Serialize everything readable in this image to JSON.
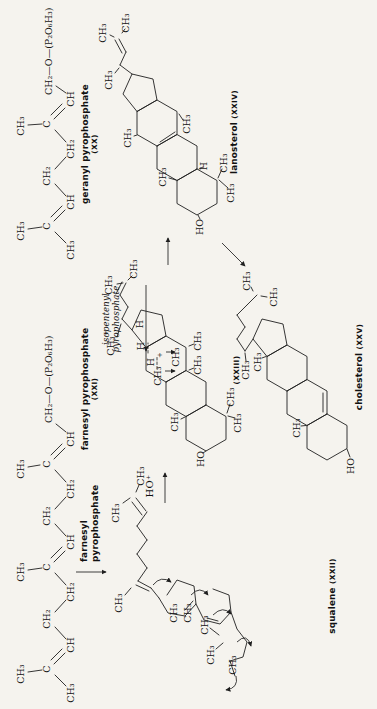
{
  "page": {
    "background_color": "#f5f3ee",
    "ink_color": "#1f1f1f"
  },
  "labels": {
    "geranyl": {
      "name": "geranyl pyrophosphate",
      "numeral": "(XX)"
    },
    "farnesyl": {
      "name": "farnesyl pyrophosphate",
      "numeral": "(XXI)"
    },
    "squalene": {
      "name": "squalene",
      "numeral": "(XXII)"
    },
    "cation": {
      "numeral": "(XXIII)"
    },
    "lanosterol": {
      "name": "lanosterol",
      "numeral": "(XXIV)"
    },
    "cholesterol": {
      "name": "cholesterol",
      "numeral": "(XXV)"
    },
    "isopentenyl_arrow": {
      "line1": "isopentenyl",
      "line2": "pyrophosphate"
    },
    "farnesyl_arrow": {
      "line1": "farnesyl",
      "line2": "pyrophosphate"
    },
    "ho_plus": "HO⁺"
  },
  "figure": {
    "texts": [
      [
        "CH₃",
        478,
        24
      ],
      [
        "C",
        483,
        50
      ],
      [
        "CH₃",
        459,
        74
      ],
      [
        "CH",
        507,
        74
      ],
      [
        "CH₂",
        533,
        50
      ],
      [
        "CH₂",
        560,
        74
      ],
      [
        "C",
        585,
        50
      ],
      [
        "CH₃",
        583,
        24
      ],
      [
        "CH",
        610,
        74
      ],
      [
        "CH₂—O—(P₂O₆H₃)",
        614,
        52,
        "start"
      ],
      [
        "CH₃",
        16,
        74
      ],
      [
        "C",
        40,
        50
      ],
      [
        "CH₃",
        35,
        24
      ],
      [
        "CH",
        64,
        74
      ],
      [
        "CH₂",
        90,
        50
      ],
      [
        "CH₂",
        117,
        74
      ],
      [
        "C",
        142,
        50
      ],
      [
        "CH₃",
        137,
        24
      ],
      [
        "CH",
        167,
        74
      ],
      [
        "CH₂",
        193,
        50
      ],
      [
        "CH₂",
        220,
        74
      ],
      [
        "C",
        245,
        50
      ],
      [
        "CH₃",
        240,
        24
      ],
      [
        "CH",
        270,
        74
      ],
      [
        "CH₂—O—(P₂O₆H₃)",
        286,
        52,
        "start"
      ],
      [
        "CH₃",
        196,
        119
      ],
      [
        "CH₃",
        233,
        144
      ],
      [
        "CH₃",
        106,
        122
      ],
      [
        "CH₃",
        96,
        177
      ],
      [
        "CH₃",
        96,
        191
      ],
      [
        "CH₃",
        54,
        214
      ],
      [
        "CH₃",
        84,
        208
      ],
      [
        "CH₃",
        44,
        236
      ],
      [
        "CH₃",
        363,
        114
      ],
      [
        "+",
        376,
        108,
        "sm"
      ],
      [
        "CH₃",
        424,
        112
      ],
      [
        "CH₃",
        440,
        137
      ],
      [
        "H",
        347,
        154
      ],
      [
        "H",
        363,
        144
      ],
      [
        "+",
        354,
        162,
        "sm"
      ],
      [
        "H",
        385,
        143
      ],
      [
        "CH₃",
        333,
        161
      ],
      [
        "CH₃",
        352,
        179
      ],
      [
        "CH₃",
        287,
        178
      ],
      [
        "CH₃",
        344,
        201
      ],
      [
        "CH₃",
        368,
        201
      ],
      [
        "HO",
        250,
        204
      ],
      [
        "CH₃",
        286,
        241
      ],
      [
        "CH₃",
        312,
        234
      ],
      [
        "HO",
        482,
        203
      ],
      [
        "CH₃",
        516,
        234
      ],
      [
        "CH₃",
        546,
        227
      ],
      [
        "H",
        543,
        207
      ],
      [
        "CH₃",
        532,
        166
      ],
      [
        "CH₃",
        571,
        131
      ],
      [
        "CH₃",
        585,
        190
      ],
      [
        "CH₃",
        629,
        112
      ],
      [
        "CH₃",
        676,
        106
      ],
      [
        "CH₃",
        686,
        129
      ],
      [
        "HO",
        243,
        354
      ],
      [
        "CH₃",
        281,
        300
      ],
      [
        "CH₃",
        347,
        261
      ],
      [
        "CH₃",
        339,
        249
      ],
      [
        "CH₃",
        428,
        250
      ],
      [
        "CH₃",
        412,
        277
      ]
    ],
    "bonds": [
      [
        466,
        66,
        477,
        55
      ],
      [
        480,
        28,
        482,
        42
      ],
      [
        488,
        54,
        499,
        65
      ],
      [
        492,
        51,
        503,
        62
      ],
      [
        513,
        66,
        525,
        55
      ],
      [
        540,
        55,
        552,
        66
      ],
      [
        567,
        66,
        579,
        55
      ],
      [
        584,
        28,
        585,
        42
      ],
      [
        590,
        54,
        601,
        65
      ],
      [
        594,
        51,
        605,
        62
      ],
      [
        616,
        66,
        623,
        56
      ],
      [
        23,
        66,
        34,
        55
      ],
      [
        37,
        28,
        39,
        42
      ],
      [
        45,
        54,
        56,
        65
      ],
      [
        49,
        51,
        60,
        62
      ],
      [
        70,
        66,
        82,
        55
      ],
      [
        97,
        55,
        109,
        66
      ],
      [
        124,
        66,
        136,
        55
      ],
      [
        139,
        28,
        141,
        42
      ],
      [
        147,
        54,
        158,
        65
      ],
      [
        151,
        51,
        162,
        62
      ],
      [
        173,
        66,
        185,
        55
      ],
      [
        200,
        55,
        212,
        66
      ],
      [
        227,
        66,
        239,
        55
      ],
      [
        242,
        28,
        244,
        40
      ],
      [
        250,
        54,
        261,
        65
      ],
      [
        254,
        51,
        265,
        62
      ],
      [
        277,
        66,
        285,
        56
      ],
      [
        206,
        123,
        211,
        130
      ],
      [
        224,
        139,
        217,
        136
      ],
      [
        211,
        136,
        198,
        146
      ],
      [
        207,
        132,
        194,
        142
      ],
      [
        197,
        147,
        183,
        137
      ],
      [
        183,
        137,
        169,
        147
      ],
      [
        169,
        147,
        155,
        137
      ],
      [
        155,
        137,
        141,
        147
      ],
      [
        141,
        147,
        128,
        138
      ],
      [
        121,
        131,
        114,
        125
      ],
      [
        128,
        138,
        121,
        151
      ],
      [
        124,
        136,
        118,
        149
      ],
      [
        121,
        151,
        111,
        159
      ],
      [
        60,
        216,
        66,
        223
      ],
      [
        81,
        210,
        74,
        219
      ],
      [
        48,
        230,
        33,
        235
      ],
      [
        99,
        185,
        108,
        193
      ],
      [
        91,
        207,
        88,
        218
      ],
      [
        379,
        132,
        390,
        122
      ],
      [
        390,
        122,
        402,
        128
      ],
      [
        402,
        128,
        414,
        120
      ],
      [
        414,
        120,
        426,
        126
      ],
      [
        415,
        116,
        427,
        122
      ],
      [
        372,
        117,
        385,
        121
      ],
      [
        425,
        117,
        426,
        123
      ],
      [
        429,
        128,
        433,
        132
      ],
      [
        290,
        181,
        292,
        185
      ],
      [
        341,
        194,
        339,
        189
      ],
      [
        365,
        194,
        363,
        189
      ],
      [
        256,
        203,
        258,
        206
      ],
      [
        291,
        235,
        293,
        228
      ],
      [
        296,
        227,
        305,
        230
      ],
      [
        490,
        200,
        494,
        198
      ],
      [
        529,
        219,
        521,
        228
      ],
      [
        531,
        218,
        540,
        222
      ],
      [
        540,
        199,
        542,
        203
      ],
      [
        531,
        169,
        529,
        176
      ],
      [
        573,
        134,
        574,
        137
      ],
      [
        589,
        183,
        595,
        179
      ],
      [
        636,
        115,
        641,
        119
      ],
      [
        672,
        114,
        674,
        110
      ],
      [
        676,
        122,
        680,
        125
      ],
      [
        635,
        132,
        644,
        120
      ],
      [
        644,
        120,
        657,
        126
      ],
      [
        657,
        126,
        670,
        119
      ],
      [
        656,
        122,
        669,
        115
      ],
      [
        567,
        160,
        577,
        175
      ],
      [
        252,
        350,
        260,
        347
      ],
      [
        283,
        301,
        283.5,
        306
      ],
      [
        351,
        262,
        352.5,
        266
      ],
      [
        348,
        246,
        356,
        245
      ],
      [
        418,
        253,
        422,
        251
      ],
      [
        413,
        261,
        412,
        267
      ],
      [
        297,
        323,
        316,
        323
      ],
      [
        370,
        253,
        358,
        245
      ],
      [
        358,
        245,
        370,
        237
      ],
      [
        370,
        237,
        382,
        245
      ],
      [
        382,
        245,
        394,
        237
      ],
      [
        394,
        237,
        404,
        247
      ],
      [
        404,
        247,
        414,
        257
      ]
    ],
    "rings": [
      [
        111,
        159,
        96,
        168,
        93,
        185,
        105,
        196,
        123,
        194,
        129,
        177,
        114,
        167
      ],
      [
        105,
        196,
        89,
        204,
        85,
        220,
        97,
        231,
        114,
        229,
        120,
        213
      ],
      [
        97,
        231,
        80,
        237,
        67,
        247,
        52,
        243,
        48,
        230
      ],
      [
        304,
        206,
        292.5,
        186,
        269.5,
        186,
        258,
        206,
        269.5,
        226,
        292.5,
        226,
        304,
        206
      ],
      [
        292.5,
        186,
        304,
        166,
        327,
        166,
        338.5,
        186,
        327,
        206,
        304,
        206,
        292.5,
        186
      ],
      [
        327,
        166,
        338.5,
        146,
        361.5,
        146,
        373,
        166,
        361.5,
        186,
        338.5,
        186,
        327,
        166
      ],
      [
        361.5,
        146,
        373,
        166,
        394,
        162,
        399,
        141,
        379,
        132,
        361.5,
        146
      ],
      [
        540,
        197,
        528.5,
        177,
        505.5,
        177,
        494,
        197,
        505.5,
        217,
        528.5,
        217,
        540,
        197
      ],
      [
        528.5,
        177,
        540,
        157,
        563,
        157,
        574.5,
        177,
        563,
        197,
        540,
        197,
        528.5,
        177
      ],
      [
        563,
        157,
        574.5,
        137,
        597.5,
        137,
        609,
        157,
        597.5,
        177,
        574.5,
        177,
        563,
        157
      ],
      [
        597.5,
        137,
        609,
        157,
        630,
        153,
        635,
        132,
        615,
        123,
        597.5,
        137
      ],
      [
        295,
        327,
        283.5,
        307,
        260.5,
        307,
        249,
        327,
        260.5,
        347,
        283.5,
        347,
        295,
        327
      ],
      [
        283.5,
        307,
        295,
        287,
        318,
        287,
        329.5,
        307,
        318,
        327,
        295,
        327,
        283.5,
        307
      ],
      [
        318,
        287,
        329.5,
        267,
        352.5,
        267,
        364,
        287,
        352.5,
        307,
        329.5,
        307,
        318,
        287
      ],
      [
        352.5,
        267,
        364,
        287,
        385,
        283,
        390,
        262,
        370,
        253,
        352.5,
        267
      ]
    ],
    "dashes": [
      [
        340,
        157,
        352,
        157
      ],
      [
        356,
        148,
        366,
        148
      ]
    ],
    "arrows": [
      [
        424,
        146,
        358,
        146
      ],
      [
        137,
        76,
        137,
        106
      ],
      [
        206,
        165,
        236,
        165
      ],
      [
        444,
        168,
        471,
        168
      ],
      [
        466,
        222,
        443,
        245
      ],
      [
        338,
        165,
        338,
        175
      ],
      [
        357,
        166,
        357,
        175
      ]
    ],
    "curves": [
      "M124,153 Q134,161 127,171",
      "M114,191 Q124,200 114,208",
      "M94,213 Q104,223 95,231",
      "M67,237 Q77,247 63,251",
      "M33,236 Q21,239 19,226"
    ]
  }
}
